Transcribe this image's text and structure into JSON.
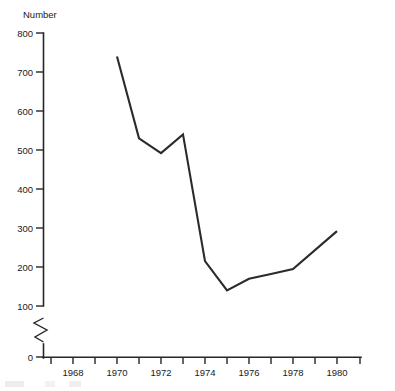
{
  "chart_data": {
    "type": "line",
    "title": "",
    "subtitle": "",
    "ylabel": "Number",
    "xlabel": "",
    "ylim": [
      0,
      800
    ],
    "xlim": [
      1967,
      1981
    ],
    "grid": false,
    "legend": null,
    "axis_break": {
      "axis": "y",
      "between": [
        0,
        100
      ],
      "symbol": "zigzag"
    },
    "y_ticks": [
      0,
      100,
      200,
      300,
      400,
      500,
      600,
      700,
      800
    ],
    "y_tick_labels": [
      "0",
      "100",
      "200",
      "300",
      "400",
      "500",
      "600",
      "700",
      "800"
    ],
    "x_ticks": [
      1967,
      1968,
      1969,
      1970,
      1971,
      1972,
      1973,
      1974,
      1975,
      1976,
      1977,
      1978,
      1979,
      1980,
      1981
    ],
    "x_tick_labels": [
      "",
      "1968",
      "",
      "1970",
      "",
      "1972",
      "",
      "1974",
      "",
      "1976",
      "",
      "1978",
      "",
      "1980",
      ""
    ],
    "series": [
      {
        "name": "Number",
        "color": "#2b2b2b",
        "x": [
          1970,
          1971,
          1972,
          1973,
          1974,
          1975,
          1976,
          1977,
          1978,
          1980
        ],
        "values": [
          740,
          530,
          492,
          540,
          215,
          140,
          170,
          182,
          195,
          292
        ]
      }
    ]
  },
  "axes": {
    "y_axis_label": "Number"
  }
}
